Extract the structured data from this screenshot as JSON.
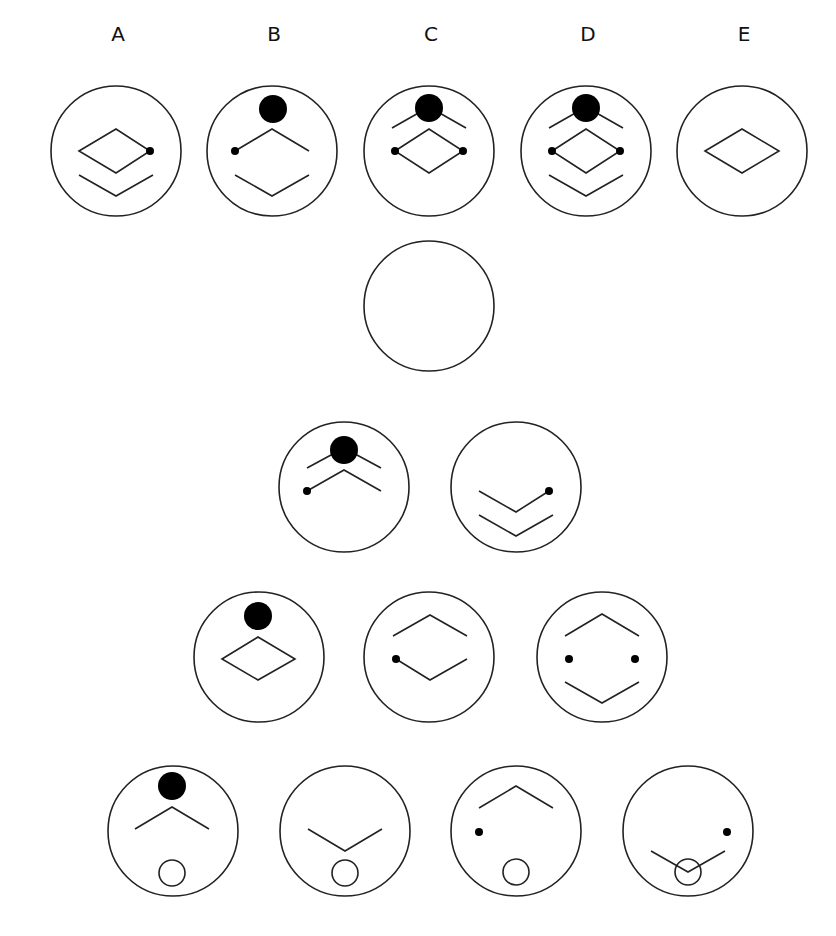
{
  "options": {
    "labels": [
      "A",
      "B",
      "C",
      "D",
      "E"
    ]
  },
  "colors": {
    "stroke": "#222222",
    "fill": "#000000",
    "background": "#ffffff"
  },
  "figures": {
    "radius": 65,
    "answer_row": [
      {
        "label": "A",
        "cx": 116,
        "cy": 151,
        "elements": [
          "diamond",
          "dot-right",
          "lower-chevron"
        ]
      },
      {
        "label": "B",
        "cx": 272,
        "cy": 151,
        "elements": [
          "big-dot-top",
          "upper-chevron-with-left-dot",
          "lower-chevron"
        ]
      },
      {
        "label": "C",
        "cx": 429,
        "cy": 151,
        "elements": [
          "big-dot-top",
          "top-chevron",
          "diamond",
          "dot-left",
          "dot-right"
        ]
      },
      {
        "label": "D",
        "cx": 586,
        "cy": 151,
        "elements": [
          "big-dot-top",
          "top-chevron",
          "diamond",
          "dot-left",
          "dot-right",
          "lower-chevron"
        ]
      },
      {
        "label": "E",
        "cx": 742,
        "cy": 151,
        "elements": [
          "diamond"
        ]
      }
    ],
    "puzzle": [
      {
        "row": 1,
        "cx": 429,
        "cy": 306,
        "elements": [
          "empty"
        ]
      },
      {
        "row": 2,
        "cx": 344,
        "cy": 487,
        "elements": [
          "big-dot-top",
          "top-chevron",
          "upper-chevron-with-left-dot"
        ]
      },
      {
        "row": 2,
        "cx": 516,
        "cy": 487,
        "elements": [
          "v-chevron-with-right-dot",
          "lower-chevron"
        ]
      },
      {
        "row": 3,
        "cx": 259,
        "cy": 657,
        "elements": [
          "big-dot-top",
          "diamond"
        ]
      },
      {
        "row": 3,
        "cx": 429,
        "cy": 657,
        "elements": [
          "upper-chevron",
          "lower-v-with-left-dot"
        ]
      },
      {
        "row": 3,
        "cx": 602,
        "cy": 657,
        "elements": [
          "upper-chevron",
          "dot-left",
          "dot-right",
          "lower-chevron"
        ]
      },
      {
        "row": 4,
        "cx": 173,
        "cy": 831,
        "elements": [
          "big-dot-top",
          "chevron",
          "small-ring"
        ]
      },
      {
        "row": 4,
        "cx": 345,
        "cy": 831,
        "elements": [
          "v-chevron",
          "small-ring"
        ]
      },
      {
        "row": 4,
        "cx": 516,
        "cy": 831,
        "elements": [
          "chevron",
          "dot-left",
          "small-ring"
        ]
      },
      {
        "row": 4,
        "cx": 688,
        "cy": 831,
        "elements": [
          "v-chevron",
          "dot-right",
          "small-ring"
        ]
      }
    ]
  }
}
